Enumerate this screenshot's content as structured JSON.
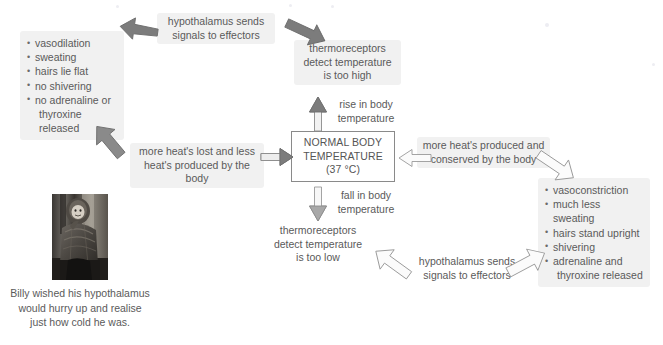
{
  "diagram": {
    "center_box": {
      "line1": "NORMAL BODY",
      "line2": "TEMPERATURE",
      "line3": "(37 °C)",
      "border_color": "#8a8a8a"
    },
    "nodes": {
      "hypothalamus_top": "hypothalamus sends\nsignals to effectors",
      "thermoreceptors_high": "thermoreceptors\ndetect temperature\nis too high",
      "rise_label": "rise in body\ntemperature",
      "fall_label": "fall in body\ntemperature",
      "heat_lost": "more heat's lost and less\nheat's produced by the body",
      "heat_produced": "more heat's produced and\nconserved by the body",
      "thermoreceptors_low": "thermoreceptors\ndetect temperature\nis too low",
      "hypothalamus_bottom": "hypothalamus sends\nsignals to effectors"
    },
    "cooling_effectors": {
      "items": [
        "vasodilation",
        "sweating",
        "hairs lie flat",
        "no shivering",
        "no adrenaline or",
        "thyroxine released"
      ],
      "continuation_index": 5
    },
    "warming_effectors": {
      "items": [
        "vasoconstriction",
        "much less sweating",
        "hairs stand upright",
        "shivering",
        "adrenaline and",
        "thyroxine released"
      ],
      "continuation_index": 5
    },
    "photo_caption": "Billy wished his hypothalamus\nwould hurry up and realise\njust how cold he was.",
    "colors": {
      "box_fill": "#f1f1f1",
      "text": "#5a5a5a",
      "arrow_dark": "#7c7c7c",
      "arrow_light": "#ffffff",
      "arrow_outline": "#9a9a9a"
    },
    "arrows": [
      {
        "name": "arrow-thermoreceptors-to-hypothalamus",
        "style": "dark",
        "direction": "up-left"
      },
      {
        "name": "arrow-hypothalamus-to-cooling-effectors",
        "style": "dark",
        "direction": "left"
      },
      {
        "name": "arrow-cooling-effectors-to-heat-lost",
        "style": "dark",
        "direction": "down-right"
      },
      {
        "name": "arrow-heat-lost-to-normal",
        "style": "dark",
        "direction": "right"
      },
      {
        "name": "arrow-rise-in-body-temperature",
        "style": "dark",
        "direction": "up"
      },
      {
        "name": "arrow-fall-in-body-temperature",
        "style": "light",
        "direction": "down"
      },
      {
        "name": "arrow-heat-produced-to-normal",
        "style": "light",
        "direction": "left"
      },
      {
        "name": "arrow-warming-effectors-to-heat-produced",
        "style": "light",
        "direction": "up-left"
      },
      {
        "name": "arrow-thermoreceptors-low-to-hypothalamus",
        "style": "light",
        "direction": "down-right"
      },
      {
        "name": "arrow-hypothalamus-to-warming-effectors",
        "style": "light",
        "direction": "up-right"
      }
    ]
  }
}
